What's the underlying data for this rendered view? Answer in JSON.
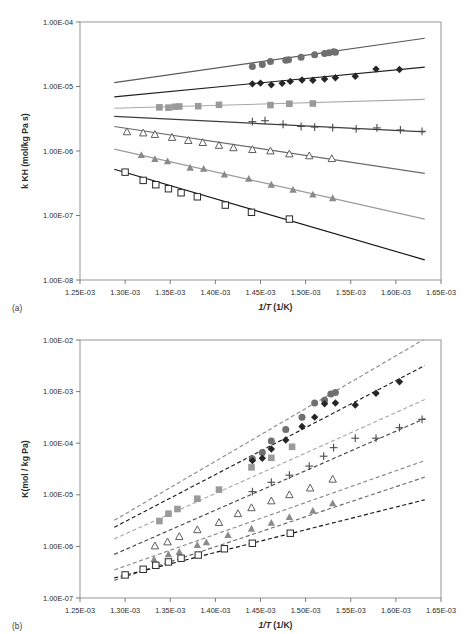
{
  "figure": {
    "panels": [
      {
        "id": "a",
        "panel_label": "(a)",
        "chart_data": {
          "type": "scatter",
          "title": "",
          "xlabel": "1/T (1/K)",
          "ylabel": "k KH (mol/kg Pa s)",
          "xlim": [
            0.00125,
            0.00165
          ],
          "ylim": [
            1e-08,
            0.0001
          ],
          "yscale": "log",
          "grid": false,
          "legend": "none",
          "xticks": [
            "1.25E-03",
            "1.30E-03",
            "1.35E-03",
            "1.40E-03",
            "1.45E-03",
            "1.50E-03",
            "1.55E-03",
            "1.60E-03",
            "1.65E-03"
          ],
          "xtick_values": [
            0.00125,
            0.0013,
            0.00135,
            0.0014,
            0.00145,
            0.0015,
            0.00155,
            0.0016,
            0.00165
          ],
          "yticks": [
            "1.00E-08",
            "1.00E-07",
            "1.00E-06",
            "1.00E-05",
            "1.00E-04"
          ],
          "ytick_values": [
            1e-08,
            1e-07,
            1e-06,
            1e-05,
            0.0001
          ],
          "linestyle": "solid",
          "series": [
            {
              "name": "series-circle",
              "marker": "filled-circle",
              "color": "#6f6f6f",
              "line_color": "#5a5a5a",
              "fit_x": [
                0.001288,
                0.001632
              ],
              "fit_y": [
                1.15e-05,
                5.6e-05
              ],
              "x": [
                0.001441,
                0.001452,
                0.001461,
                0.001478,
                0.001481,
                0.001495,
                0.00151,
                0.001521,
                0.001526,
                0.001531,
                0.001533
              ],
              "y": [
                2.05e-05,
                2.2e-05,
                2.45e-05,
                2.55e-05,
                2.6e-05,
                2.85e-05,
                3.1e-05,
                3.25e-05,
                3.35e-05,
                3.45e-05,
                3.4e-05
              ]
            },
            {
              "name": "series-diamond",
              "marker": "filled-diamond",
              "color": "#262626",
              "line_color": "#1f1f1f",
              "fit_x": [
                0.001288,
                0.001632
              ],
              "fit_y": [
                6.9e-06,
                2e-05
              ],
              "x": [
                0.001441,
                0.00145,
                0.001462,
                0.001474,
                0.001483,
                0.001496,
                0.001508,
                0.001521,
                0.001533,
                0.001555,
                0.001578,
                0.001604
              ],
              "y": [
                1.1e-05,
                1.13e-05,
                1.06e-05,
                1.12e-05,
                1.2e-05,
                1.26e-05,
                1.25e-05,
                1.31e-05,
                1.37e-05,
                1.44e-05,
                1.86e-05,
                1.83e-05
              ]
            },
            {
              "name": "series-square-filled",
              "marker": "filled-square",
              "color": "#9a9a9a",
              "line_color": "#a8a8a8",
              "fit_x": [
                0.001288,
                0.001632
              ],
              "fit_y": [
                4.6e-06,
                6.3e-06
              ],
              "x": [
                0.001338,
                0.001348,
                0.001355,
                0.00136,
                0.001381,
                0.001404,
                0.001461,
                0.001482,
                0.001508
              ],
              "y": [
                4.75e-06,
                4.7e-06,
                4.85e-06,
                4.9e-06,
                4.95e-06,
                5.2e-06,
                5.15e-06,
                5.4e-06,
                5.45e-06
              ]
            },
            {
              "name": "series-plus",
              "marker": "plus",
              "color": "#4a4a4a",
              "line_color": "#3d3d3d",
              "fit_x": [
                0.001288,
                0.001632
              ],
              "fit_y": [
                3.45e-06,
                1.98e-06
              ],
              "x": [
                0.001441,
                0.001455,
                0.001475,
                0.001495,
                0.00151,
                0.00153,
                0.001556,
                0.001579,
                0.001605,
                0.001629
              ],
              "y": [
                2.85e-06,
                2.95e-06,
                2.6e-06,
                2.4e-06,
                2.35e-06,
                2.3e-06,
                2.2e-06,
                2.28e-06,
                2.12e-06,
                2.02e-06
              ]
            },
            {
              "name": "series-triangle-open",
              "marker": "open-triangle",
              "color": "#5d5d5d",
              "line_color": "#6a6a6a",
              "fit_x": [
                0.001288,
                0.001632
              ],
              "fit_y": [
                2.4e-06,
                4.5e-07
              ],
              "x": [
                0.001302,
                0.00132,
                0.001333,
                0.001352,
                0.00137,
                0.001386,
                0.001404,
                0.00142,
                0.001441,
                0.001461,
                0.001482,
                0.001504,
                0.001529
              ],
              "y": [
                1.98e-06,
                1.9e-06,
                1.8e-06,
                1.62e-06,
                1.45e-06,
                1.35e-06,
                1.22e-06,
                1.12e-06,
                1.05e-06,
                1e-06,
                9e-07,
                8.4e-07,
                7.6e-07
              ]
            },
            {
              "name": "series-triangle-filled",
              "marker": "filled-triangle",
              "color": "#8a8a8a",
              "line_color": "#9a9a9a",
              "fit_x": [
                0.001288,
                0.001632
              ],
              "fit_y": [
                1.07e-06,
                8.8e-08
              ],
              "x": [
                0.001318,
                0.001333,
                0.001347,
                0.001372,
                0.001387,
                0.00141,
                0.001437,
                0.001462,
                0.001486,
                0.001508,
                0.00153
              ],
              "y": [
                8.6e-07,
                7.5e-07,
                6.9e-07,
                5.5e-07,
                5.3e-07,
                4.3e-07,
                3.7e-07,
                3e-07,
                2.5e-07,
                2.1e-07,
                1.85e-07
              ]
            },
            {
              "name": "series-square-open",
              "marker": "open-square",
              "color": "#2a2a2a",
              "line_color": "#141414",
              "fit_x": [
                0.001288,
                0.001632
              ],
              "fit_y": [
                5.2e-07,
                2.05e-08
              ],
              "x": [
                0.0013,
                0.00132,
                0.001334,
                0.001348,
                0.001362,
                0.00138,
                0.001411,
                0.00144,
                0.001482
              ],
              "y": [
                4.7e-07,
                3.5e-07,
                3e-07,
                2.6e-07,
                2.25e-07,
                1.95e-07,
                1.45e-07,
                1.12e-07,
                8.8e-08
              ]
            }
          ]
        }
      },
      {
        "id": "b",
        "panel_label": "(b)",
        "chart_data": {
          "type": "scatter",
          "title": "",
          "xlabel": "1/T (1/K)",
          "ylabel": "K(mol / kg Pa)",
          "xlim": [
            0.00125,
            0.00165
          ],
          "ylim": [
            1e-07,
            0.01
          ],
          "yscale": "log",
          "grid": false,
          "legend": "none",
          "xticks": [
            "1.25E-03",
            "1.30E-03",
            "1.35E-03",
            "1.40E-03",
            "1.45E-03",
            "1.50E-03",
            "1.55E-03",
            "1.60E-03",
            "1.65E-03"
          ],
          "xtick_values": [
            0.00125,
            0.0013,
            0.00135,
            0.0014,
            0.00145,
            0.0015,
            0.00155,
            0.0016,
            0.00165
          ],
          "yticks": [
            "1.00E-07",
            "1.00E-06",
            "1.00E-05",
            "1.00E-04",
            "1.00E-03",
            "1.00E-02"
          ],
          "ytick_values": [
            1e-07,
            1e-06,
            1e-05,
            0.0001,
            0.001,
            0.01
          ],
          "linestyle": "dashed",
          "series": [
            {
              "name": "series-circle",
              "marker": "filled-circle",
              "color": "#6f6f6f",
              "line_color": "#8c8c8c",
              "fit_x": [
                0.001288,
                0.001632
              ],
              "fit_y": [
                3.2e-06,
                0.0105
              ],
              "x": [
                0.001441,
                0.001452,
                0.001462,
                0.001478,
                0.001496,
                0.00151,
                0.001521,
                0.001528,
                0.001533
              ],
              "y": [
                5e-05,
                6.6e-05,
                0.00011,
                0.000185,
                0.00032,
                0.0006,
                0.00068,
                0.0009,
                0.00096
              ]
            },
            {
              "name": "series-diamond",
              "marker": "filled-diamond",
              "color": "#262626",
              "line_color": "#1f1f1f",
              "fit_x": [
                0.001288,
                0.001632
              ],
              "fit_y": [
                2.35e-06,
                0.0032
              ],
              "x": [
                0.001441,
                0.001452,
                0.001462,
                0.001478,
                0.001496,
                0.00151,
                0.001521,
                0.001533,
                0.001555,
                0.001578,
                0.001604
              ],
              "y": [
                4.6e-05,
                5.1e-05,
                7.7e-05,
                0.000115,
                0.00021,
                0.00032,
                0.00058,
                0.0006,
                0.00055,
                0.00093,
                0.00155
              ]
            },
            {
              "name": "series-square-filled",
              "marker": "filled-square",
              "color": "#9a9a9a",
              "line_color": "#a8a8a8",
              "fit_x": [
                0.001288,
                0.001632
              ],
              "fit_y": [
                1.4e-06,
                0.0007
              ],
              "x": [
                0.001338,
                0.001348,
                0.001358,
                0.00138,
                0.001404,
                0.00144,
                0.001462,
                0.001485
              ],
              "y": [
                3.1e-06,
                4.3e-06,
                5.3e-06,
                8.4e-06,
                1.26e-05,
                3.4e-05,
                5.2e-05,
                8.5e-05
              ]
            },
            {
              "name": "series-plus",
              "marker": "plus",
              "color": "#4a4a4a",
              "line_color": "#4a4a4a",
              "fit_x": [
                0.001288,
                0.001632
              ],
              "fit_y": [
                7e-07,
                0.0003
              ],
              "x": [
                0.001441,
                0.001462,
                0.001482,
                0.001504,
                0.00152,
                0.001531,
                0.001555,
                0.001578,
                0.001604,
                0.001629
              ],
              "y": [
                1.15e-05,
                1.75e-05,
                2.4e-05,
                3.6e-05,
                5.6e-05,
                8.2e-05,
                0.000125,
                0.000125,
                0.0002,
                0.00029
              ]
            },
            {
              "name": "series-triangle-open",
              "marker": "open-triangle",
              "color": "#5d5d5d",
              "line_color": "#8a8a8a",
              "fit_x": [
                0.001288,
                0.001632
              ],
              "fit_y": [
                3.5e-07,
                4.6e-05
              ],
              "x": [
                0.001333,
                0.001347,
                0.00136,
                0.00138,
                0.001404,
                0.001425,
                0.00144,
                0.001462,
                0.001482,
                0.001505,
                0.00153
              ],
              "y": [
                1.02e-06,
                1.22e-06,
                1.55e-06,
                2.1e-06,
                2.9e-06,
                4.3e-06,
                5.6e-06,
                7.6e-06,
                1e-05,
                1.35e-05,
                2e-05
              ]
            },
            {
              "name": "series-triangle-filled",
              "marker": "filled-triangle",
              "color": "#8a8a8a",
              "line_color": "#6a6a6a",
              "fit_x": [
                0.001288,
                0.001632
              ],
              "fit_y": [
                2.2e-07,
                2.2e-05
              ],
              "x": [
                0.001332,
                0.001348,
                0.00136,
                0.00138,
                0.00139,
                0.001414,
                0.00144,
                0.001462,
                0.001482,
                0.001508,
                0.00153
              ],
              "y": [
                5.6e-07,
                7e-07,
                7.8e-07,
                1.06e-06,
                1.2e-06,
                1.65e-06,
                2.2e-06,
                2.85e-06,
                3.7e-06,
                4.9e-06,
                6.8e-06
              ]
            },
            {
              "name": "series-square-open",
              "marker": "open-square",
              "color": "#2a2a2a",
              "line_color": "#141414",
              "fit_x": [
                0.001288,
                0.001632
              ],
              "fit_y": [
                2.45e-07,
                8e-06
              ],
              "x": [
                0.0013,
                0.00132,
                0.001334,
                0.001348,
                0.001362,
                0.001381,
                0.00141,
                0.001441,
                0.001483
              ],
              "y": [
                2.8e-07,
                3.6e-07,
                4.3e-07,
                5e-07,
                5.9e-07,
                6.8e-07,
                9e-07,
                1.15e-06,
                1.8e-06
              ]
            }
          ]
        }
      }
    ]
  }
}
